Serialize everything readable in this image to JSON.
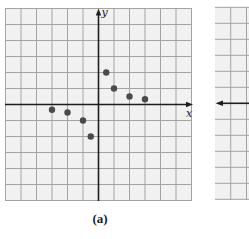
{
  "figure": {
    "caption": "(a)",
    "colors": {
      "paper": "#ffffff",
      "grid_bg": "#f1f1f1",
      "grid_line": "#a3a3a3",
      "axis": "#1e1e1e",
      "point": "#4a4a4a"
    }
  },
  "chart_data": [
    {
      "type": "scatter",
      "title": "",
      "caption": "(a)",
      "xlabel": "x",
      "ylabel": "y",
      "xlim": [
        -6,
        6
      ],
      "ylim": [
        -6,
        6
      ],
      "grid": true,
      "tick_labels": false,
      "series": [
        {
          "name": "points",
          "x": [
            -3,
            -2,
            -1,
            -0.5,
            0.5,
            1,
            2,
            3
          ],
          "y": [
            -0.33,
            -0.5,
            -1,
            -2,
            2,
            1,
            0.5,
            0.33
          ]
        }
      ]
    },
    {
      "type": "scatter",
      "title": "",
      "note": "Second panel partially visible at right edge; only grid and x-axis (left-pointing arrow) visible",
      "grid": true,
      "series": []
    }
  ]
}
